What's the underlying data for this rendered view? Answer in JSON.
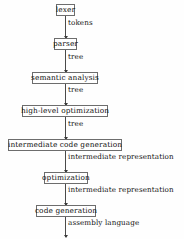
{
  "diagram": {
    "type": "flowchart-vertical",
    "background_color": "#fefefe",
    "box_border_color": "#6d6d6d",
    "connector_color": "#4a4a4a",
    "text_color": "#101010",
    "stages": [
      {
        "label": "lexer",
        "box_left": 56,
        "box_width": 19,
        "top": 4
      },
      {
        "label": "parser",
        "box_left": 54,
        "box_width": 23,
        "top": 38
      },
      {
        "label": "semantic analysis",
        "box_left": 32,
        "box_width": 66,
        "top": 72
      },
      {
        "label": "high-level optimization",
        "box_left": 22,
        "box_width": 86,
        "top": 105
      },
      {
        "label": "intermediate code generation",
        "box_left": 8,
        "box_width": 114,
        "top": 139
      },
      {
        "label": "optimization",
        "box_left": 44,
        "box_width": 44,
        "top": 172
      },
      {
        "label": "code generation",
        "box_left": 36,
        "box_width": 60,
        "top": 205
      }
    ],
    "edges": [
      {
        "label": "tokens",
        "top": 16,
        "height": 22,
        "label_top": 19
      },
      {
        "label": "tree",
        "top": 50,
        "height": 22,
        "label_top": 53
      },
      {
        "label": "tree",
        "top": 84,
        "height": 21,
        "label_top": 86
      },
      {
        "label": "tree",
        "top": 117,
        "height": 22,
        "label_top": 120
      },
      {
        "label": "intermediate representation",
        "top": 151,
        "height": 21,
        "label_top": 153
      },
      {
        "label": "intermediate representation",
        "top": 184,
        "height": 21,
        "label_top": 186
      },
      {
        "label": "assembly language",
        "top": 217,
        "height": 20,
        "label_top": 219
      }
    ]
  }
}
